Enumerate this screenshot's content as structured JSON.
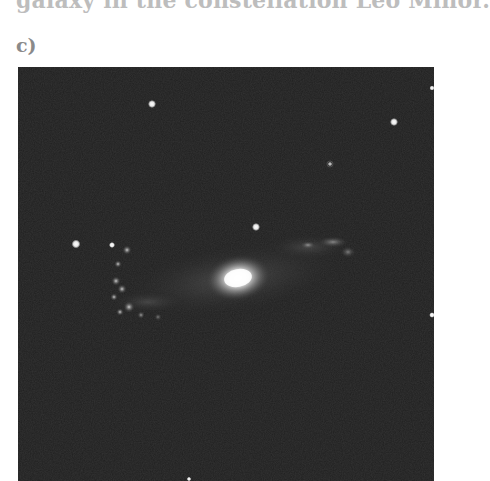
{
  "document": {
    "top_text": "galaxy in the constellation Leo Minor.",
    "figure_label": "c)"
  },
  "figure": {
    "background_color": "#1f1f1f",
    "core": {
      "x": 220,
      "y": 211,
      "rx": 22,
      "ry": 15
    },
    "stars": [
      {
        "x": 134,
        "y": 37,
        "r": 2.6
      },
      {
        "x": 376,
        "y": 55,
        "r": 2.6
      },
      {
        "x": 414,
        "y": 21,
        "r": 1.8
      },
      {
        "x": 238,
        "y": 160,
        "r": 2.6
      },
      {
        "x": 58,
        "y": 177,
        "r": 2.8
      },
      {
        "x": 95,
        "y": 178,
        "r": 2.0
      },
      {
        "x": 312,
        "y": 97,
        "r": 1.6
      },
      {
        "x": 414,
        "y": 248,
        "r": 1.8
      },
      {
        "x": 171,
        "y": 412,
        "r": 1.6
      }
    ]
  }
}
